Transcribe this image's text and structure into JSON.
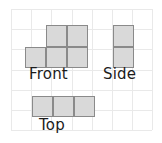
{
  "figure": {
    "grid": {
      "columns": 7,
      "rows": 6,
      "cell_size": 20.2,
      "origin_x": 11,
      "origin_y": 9,
      "line_color": "#e9e9e9",
      "visible": true
    },
    "style": {
      "cell_fill": "#d9d9d9",
      "cell_stroke": "#8a8a8a",
      "label_color": "#1b1b1b",
      "background": "#ffffff"
    },
    "views": [
      {
        "id": "front",
        "label": "Front",
        "label_x": 29,
        "label_y": 67,
        "shape_description": "step shape: two squares on the upper row, three squares on the lower row",
        "cell_count": 5,
        "cells": [
          {
            "x": 45.5,
            "y": 25.0,
            "w": 21.0,
            "h": 21.5
          },
          {
            "x": 66.5,
            "y": 25.0,
            "w": 21.0,
            "h": 21.5
          },
          {
            "x": 24.5,
            "y": 46.5,
            "w": 21.0,
            "h": 21.5
          },
          {
            "x": 45.5,
            "y": 46.5,
            "w": 21.0,
            "h": 21.5
          },
          {
            "x": 66.5,
            "y": 46.5,
            "w": 21.0,
            "h": 21.5
          }
        ]
      },
      {
        "id": "side",
        "label": "Side",
        "label_x": 103,
        "label_y": 67,
        "shape_description": "vertical stack of two squares",
        "cell_count": 2,
        "cells": [
          {
            "x": 112.5,
            "y": 25.0,
            "w": 21.0,
            "h": 21.5
          },
          {
            "x": 112.5,
            "y": 46.5,
            "w": 21.0,
            "h": 21.5
          }
        ]
      },
      {
        "id": "top",
        "label": "Top",
        "label_x": 39,
        "label_y": 118,
        "shape_description": "horizontal row of three squares",
        "cell_count": 3,
        "cells": [
          {
            "x": 32.0,
            "y": 95.5,
            "w": 21.0,
            "h": 21.5
          },
          {
            "x": 53.0,
            "y": 95.5,
            "w": 21.0,
            "h": 21.5
          },
          {
            "x": 74.0,
            "y": 95.5,
            "w": 21.0,
            "h": 21.5
          }
        ]
      }
    ]
  }
}
